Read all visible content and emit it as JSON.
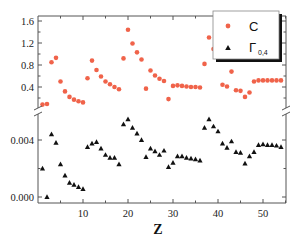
{
  "chart_data": {
    "type": "scatter",
    "title": "",
    "xlabel": "Z",
    "x_ticks": [
      10,
      20,
      30,
      40,
      50
    ],
    "xlim": [
      0,
      55
    ],
    "panels": [
      {
        "name": "upper",
        "ylabel": "",
        "y_ticks": [
          "0.4",
          "0.8",
          "1.2",
          "1.6"
        ],
        "y_tick_values": [
          0.4,
          0.8,
          1.2,
          1.6
        ],
        "ylim": [
          0.0,
          1.7
        ]
      },
      {
        "name": "lower",
        "ylabel": "",
        "y_ticks": [
          "0.000",
          "0.004"
        ],
        "y_tick_values": [
          0.0,
          0.004
        ],
        "ylim": [
          -0.0003,
          0.0058
        ]
      }
    ],
    "axis_break": true,
    "grid": false,
    "legend_position": "upper right",
    "x": [
      1,
      2,
      3,
      4,
      5,
      6,
      7,
      8,
      9,
      10,
      11,
      12,
      13,
      14,
      15,
      16,
      17,
      18,
      19,
      20,
      21,
      22,
      23,
      24,
      25,
      26,
      27,
      28,
      29,
      30,
      31,
      32,
      33,
      34,
      35,
      36,
      37,
      38,
      39,
      40,
      41,
      42,
      43,
      44,
      45,
      46,
      47,
      48,
      49,
      50,
      51,
      52,
      53,
      54
    ],
    "series": [
      {
        "name": "C",
        "panel": "upper",
        "marker": "circle",
        "color": "#f0634a",
        "values": [
          0.08,
          0.09,
          0.85,
          0.93,
          0.5,
          0.32,
          0.22,
          0.17,
          0.14,
          0.12,
          0.56,
          0.88,
          0.71,
          0.59,
          0.5,
          0.45,
          0.4,
          0.36,
          0.92,
          1.44,
          1.19,
          1.03,
          0.9,
          0.37,
          0.7,
          0.61,
          0.55,
          0.51,
          0.18,
          0.42,
          0.43,
          0.42,
          0.41,
          0.4,
          0.4,
          0.39,
          0.82,
          1.3,
          1.09,
          0.96,
          0.44,
          0.41,
          0.68,
          0.34,
          0.33,
          0.22,
          0.3,
          0.5,
          0.52,
          0.52,
          0.52,
          0.52,
          0.52,
          0.52
        ]
      },
      {
        "name": "Γ0,4",
        "panel": "lower",
        "marker": "triangle",
        "color": "#111111",
        "values": [
          0.002,
          0.0,
          0.0044,
          0.0038,
          0.0023,
          0.0015,
          0.001,
          0.00085,
          0.0007,
          0.00055,
          0.0035,
          0.00375,
          0.00385,
          0.0034,
          0.00295,
          0.00275,
          0.00275,
          0.0023,
          0.0051,
          0.00545,
          0.00485,
          0.00445,
          0.004,
          0.0028,
          0.0034,
          0.0032,
          0.00295,
          0.00325,
          0.0021,
          0.0024,
          0.00285,
          0.00285,
          0.00275,
          0.0027,
          0.00265,
          0.00255,
          0.00485,
          0.00545,
          0.00495,
          0.0046,
          0.00375,
          0.00345,
          0.0039,
          0.00315,
          0.0031,
          0.00235,
          0.00285,
          0.00315,
          0.00365,
          0.0037,
          0.00365,
          0.00365,
          0.0036,
          0.0035
        ]
      }
    ]
  },
  "legend": {
    "items": [
      {
        "label": "C",
        "subscript": ""
      },
      {
        "label": "Γ",
        "subscript": "0,4"
      }
    ]
  },
  "axes": {
    "xlabel": "Z",
    "x_tick_labels": [
      "10",
      "20",
      "30",
      "40",
      "50"
    ],
    "upper_y_tick_labels": [
      "1.6",
      "1.2",
      "0.8",
      "0.4"
    ],
    "lower_y_tick_labels": [
      "0.004",
      "0.000"
    ]
  },
  "colors": {
    "c_series": "#f0634a",
    "gamma_series": "#111111",
    "axis": "#555555"
  }
}
